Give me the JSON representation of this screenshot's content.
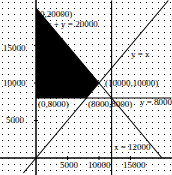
{
  "chart_data": {
    "type": "line",
    "title": "",
    "xlabel": "",
    "ylabel": "",
    "xlim": [
      -1500,
      21500
    ],
    "ylim": [
      -2300,
      21000
    ],
    "grid": "dotted",
    "x_ticks": [
      5000,
      10000,
      15000
    ],
    "y_ticks": [
      5000,
      10000,
      15000
    ],
    "lines": [
      {
        "name": "x + y = 20000",
        "points": [
          [
            0,
            20000
          ],
          [
            20000,
            0
          ]
        ]
      },
      {
        "name": "y = x",
        "points": [
          [
            -2000,
            -2000
          ],
          [
            21000,
            21000
          ]
        ]
      },
      {
        "name": "y = 8000",
        "points": [
          [
            0,
            8000
          ],
          [
            21500,
            8000
          ]
        ]
      },
      {
        "name": "x = 12000",
        "points": [
          [
            12000,
            -2300
          ],
          [
            12000,
            21000
          ]
        ]
      }
    ],
    "shaded_region": {
      "description": "feasible region",
      "vertices": [
        [
          0,
          20000
        ],
        [
          10000,
          10000
        ],
        [
          8000,
          8000
        ],
        [
          0,
          8000
        ]
      ],
      "color": "#000000"
    },
    "points": [
      {
        "label": "(0,20000)",
        "x": 0,
        "y": 20000
      },
      {
        "label": "(10000,10000)",
        "x": 10000,
        "y": 10000
      },
      {
        "label": "(8000,8000)",
        "x": 8000,
        "y": 8000
      },
      {
        "label": "(0,8000)",
        "x": 0,
        "y": 8000
      }
    ],
    "annotations": [
      {
        "text": "(0,20000)",
        "x": 37,
        "y": 17
      },
      {
        "text": "x + y = 20000",
        "x": 47,
        "y": 27
      },
      {
        "text": "y = x",
        "x": 131,
        "y": 57
      },
      {
        "text": "(10000,10000)",
        "x": 105,
        "y": 86
      },
      {
        "text": "(0,8000)",
        "x": 38,
        "y": 107
      },
      {
        "text": "(8000,8000)",
        "x": 88,
        "y": 107
      },
      {
        "text": "y = 8000",
        "x": 140,
        "y": 105
      },
      {
        "text": "x = 12000",
        "x": 114,
        "y": 150
      }
    ],
    "tick_labels": {
      "x": [
        {
          "text": "5000",
          "x": 60,
          "y": 168
        },
        {
          "text": "10000",
          "x": 88,
          "y": 168
        },
        {
          "text": "15000",
          "x": 123,
          "y": 168
        }
      ],
      "y": [
        {
          "text": "15000",
          "x": 3,
          "y": 51
        },
        {
          "text": "10000",
          "x": 3,
          "y": 86
        },
        {
          "text": "5000",
          "x": 6,
          "y": 123
        }
      ]
    }
  },
  "layout": {
    "origin_px": [
      36,
      158
    ],
    "px_per_unit_x": 0.0063,
    "px_per_unit_y": 0.0075
  }
}
